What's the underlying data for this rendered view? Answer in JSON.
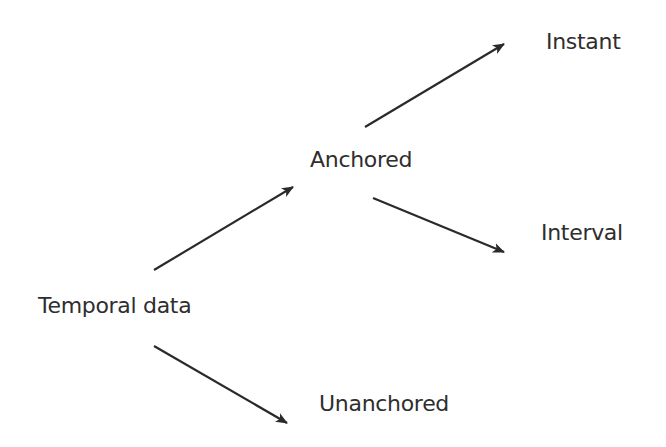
{
  "diagram": {
    "colors": {
      "text": "#2e2e2e",
      "arrow": "#2a2a2a",
      "background": "#ffffff"
    },
    "nodes": {
      "temporal_data": {
        "label": "Temporal data",
        "x": 38,
        "y": 295
      },
      "anchored": {
        "label": "Anchored",
        "x": 310,
        "y": 149
      },
      "unanchored": {
        "label": "Unanchored",
        "x": 319,
        "y": 393
      },
      "instant": {
        "label": "Instant",
        "x": 546,
        "y": 31
      },
      "interval": {
        "label": "Interval",
        "x": 541,
        "y": 222
      }
    },
    "edges": [
      {
        "from": "temporal_data",
        "to": "anchored",
        "x1": 154,
        "y1": 270,
        "x2": 293,
        "y2": 187
      },
      {
        "from": "temporal_data",
        "to": "unanchored",
        "x1": 154,
        "y1": 346,
        "x2": 287,
        "y2": 423
      },
      {
        "from": "anchored",
        "to": "instant",
        "x1": 365,
        "y1": 127,
        "x2": 504,
        "y2": 44
      },
      {
        "from": "anchored",
        "to": "interval",
        "x1": 373,
        "y1": 198,
        "x2": 504,
        "y2": 252
      }
    ]
  }
}
